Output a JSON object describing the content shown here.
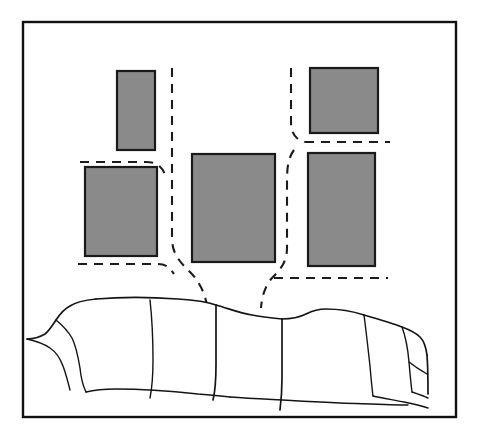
{
  "figure": {
    "kind": "line-illustration",
    "width": 478,
    "height": 440,
    "background_color": "#ffffff",
    "caption": ""
  },
  "colors": {
    "artwork_fill": "#8a8a8a",
    "artwork_stroke": "#1a1a1a",
    "line_stroke": "#141414",
    "dash_stroke": "#1b1b1b",
    "frame_stroke": "#111111",
    "page_background": "#ffffff"
  },
  "border": {
    "label": "Outer picture border",
    "x": 23,
    "y": 22,
    "width": 433,
    "height": 395
  },
  "artworks": [
    {
      "id": "artwork-upper-left",
      "label": "Upper left portrait panel",
      "x": 117,
      "y": 71,
      "width": 38,
      "height": 79,
      "fill": "#8a8a8a",
      "orientation": "portrait"
    },
    {
      "id": "artwork-lower-left",
      "label": "Lower left square panel",
      "x": 85,
      "y": 167,
      "width": 72,
      "height": 89,
      "fill": "#8a8a8a",
      "orientation": "landscape-square"
    },
    {
      "id": "artwork-center",
      "label": "Center large panel",
      "x": 192,
      "y": 154,
      "width": 83,
      "height": 108,
      "fill": "#8a8a8a",
      "orientation": "portrait"
    },
    {
      "id": "artwork-upper-right",
      "label": "Upper right square panel",
      "x": 310,
      "y": 68,
      "width": 68,
      "height": 65,
      "fill": "#8a8a8a",
      "orientation": "square"
    },
    {
      "id": "artwork-lower-right",
      "label": "Lower right tall panel",
      "x": 308,
      "y": 153,
      "width": 67,
      "height": 113,
      "fill": "#8a8a8a",
      "orientation": "portrait"
    }
  ],
  "guides": [
    {
      "id": "guide-left-vertical",
      "label": "Left grouping vertical guide",
      "path": "M 172 68 L 172 238 C 172 254 180 262 190 272 C 198 280 205 292 207 306"
    },
    {
      "id": "guide-left-upper-horizontal",
      "label": "Left grouping upper horizontal guide",
      "path": "M 80 162 L 146 162 C 158 162 164 168 166 179"
    },
    {
      "id": "guide-left-lower-horizontal",
      "label": "Left grouping lower horizontal guide",
      "path": "M 78 264 L 158 264 C 166 264 170 268 174 274"
    },
    {
      "id": "guide-right-vertical",
      "label": "Right grouping vertical guide",
      "path": "M 291 68 L 291 122 C 291 134 296 140 305 142"
    },
    {
      "id": "guide-right-upper-horizontal",
      "label": "Right grouping upper horizontal guide",
      "path": "M 305 142 L 390 142"
    },
    {
      "id": "guide-right-descender",
      "label": "Right grouping descending guide",
      "path": "M 294 150 C 288 158 287 168 287 182 L 287 248 C 287 262 280 270 272 278 C 265 286 262 296 261 308"
    },
    {
      "id": "guide-right-lower-horizontal",
      "label": "Right grouping lower horizontal guide",
      "path": "M 274 278 L 388 278"
    }
  ],
  "sofa": {
    "label": "Three seat sofa",
    "outline_paths": [
      "M 27 339 C 34 339 40 337 45 334 C 49 331 52 326 56 320 C 60 314 64 309 70 306 C 76 302 86 300 96 299",
      "M 96 299 C 120 297 150 297 178 299 C 196 300 208 302 216 305",
      "M 216 305 C 230 309 240 313 252 315 C 262 317 272 318 282 319",
      "M 282 319 C 294 319 300 317 306 314 C 312 311 318 309 326 309 C 340 309 352 311 364 315",
      "M 364 315 C 378 319 392 323 402 327 C 410 330 416 333 420 337 C 424 341 426 347 427 355",
      "M 427 355 C 428 368 428 382 428 394",
      "M 56 320 C 62 325 68 331 72 338 C 76 346 78 356 80 368 C 81 378 83 386 86 392",
      "M 86 392 C 94 390 104 389 116 389 C 140 389 170 391 198 394 C 212 395 222 396 230 397",
      "M 27 339 C 36 341 44 344 50 348 C 56 352 60 358 63 366 C 66 374 68 382 70 390",
      "M 150 300 C 152 318 153 340 153 360 C 153 376 152 388 150 398",
      "M 216 305 C 216 322 216 344 216 364 C 216 380 215 392 213 400",
      "M 282 319 C 282 336 282 358 282 378 C 282 392 281 402 280 410",
      "M 364 315 C 366 330 368 348 370 366 C 371 378 372 388 373 396",
      "M 402 327 C 406 338 408 350 409 362 C 410 374 411 384 412 392",
      "M 230 397 C 260 399 300 401 340 403 C 370 404 392 405 408 405",
      "M 373 396 C 382 398 394 400 404 402 C 414 404 422 406 428 408",
      "M 409 362 C 414 366 420 370 427 374",
      "M 412 392 C 418 394 424 396 428 398"
    ],
    "seats": [
      {
        "id": "seat-left",
        "label": "Left seat cushion"
      },
      {
        "id": "seat-middle",
        "label": "Middle seat cushion"
      },
      {
        "id": "seat-right",
        "label": "Right seat cushion"
      }
    ],
    "arms": [
      {
        "id": "arm-left",
        "label": "Left armrest"
      },
      {
        "id": "arm-right",
        "label": "Right armrest"
      }
    ]
  }
}
